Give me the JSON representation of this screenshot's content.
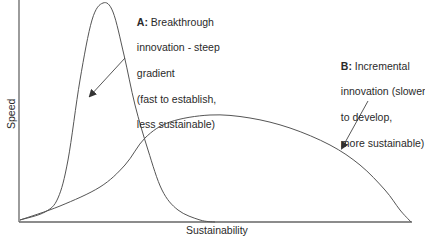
{
  "diagram": {
    "axes": {
      "y_label": "Speed",
      "x_label": "Sustainability"
    },
    "curves": [
      {
        "id": "A",
        "name": "Breakthrough innovation",
        "description": "steep gradient (fast to establish, less sustainable)",
        "points": [
          [
            20,
            220
          ],
          [
            45,
            212
          ],
          [
            58,
            198
          ],
          [
            68,
            160
          ],
          [
            80,
            80
          ],
          [
            92,
            20
          ],
          [
            103,
            3
          ],
          [
            113,
            12
          ],
          [
            124,
            55
          ],
          [
            135,
            105
          ],
          [
            148,
            150
          ],
          [
            162,
            190
          ],
          [
            178,
            210
          ],
          [
            200,
            220
          ],
          [
            215,
            222
          ]
        ]
      },
      {
        "id": "B",
        "name": "Incremental innovation",
        "description": "slower to develop, more sustainable",
        "points": [
          [
            20,
            220
          ],
          [
            60,
            206
          ],
          [
            100,
            187
          ],
          [
            125,
            165
          ],
          [
            145,
            138
          ],
          [
            170,
            122
          ],
          [
            210,
            115
          ],
          [
            250,
            118
          ],
          [
            290,
            128
          ],
          [
            330,
            145
          ],
          [
            360,
            165
          ],
          [
            385,
            190
          ],
          [
            400,
            210
          ],
          [
            411,
            222
          ]
        ]
      }
    ],
    "annotations": [
      {
        "id": "A",
        "prefix": "A:",
        "lines": [
          " Breakthrough",
          "innovation - steep",
          "gradient",
          "(fast to establish,",
          "less sustainable)"
        ],
        "arrow_from": [
          125,
          58
        ],
        "arrow_to": [
          90,
          96
        ]
      },
      {
        "id": "B",
        "prefix": "B:",
        "lines": [
          " Incremental",
          "innovation (slower",
          "to develop,",
          "more sustainable)"
        ],
        "arrow_from": [
          368,
          101
        ],
        "arrow_to": [
          342,
          148
        ]
      }
    ],
    "colors": {
      "line": "#555555",
      "axis": "#666666",
      "text": "#2a2a2a",
      "background": "#ffffff"
    }
  }
}
